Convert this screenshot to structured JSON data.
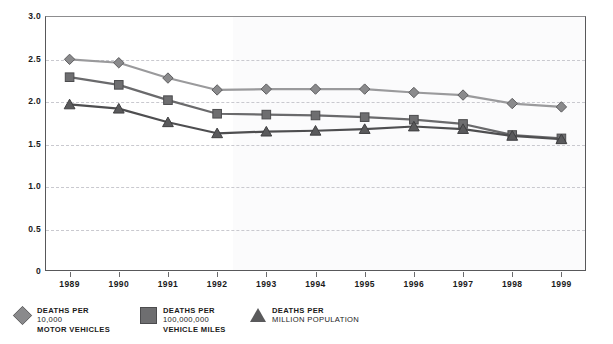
{
  "chart_data": {
    "type": "line",
    "title": "",
    "xlabel": "",
    "ylabel": "",
    "x": [
      "1989",
      "1990",
      "1991",
      "1992",
      "1993",
      "1994",
      "1995",
      "1996",
      "1997",
      "1998",
      "1999"
    ],
    "categories": [
      "1989",
      "1990",
      "1991",
      "1992",
      "1993",
      "1994",
      "1995",
      "1996",
      "1997",
      "1998",
      "1999"
    ],
    "ylim": [
      0,
      3.0
    ],
    "yticks": [
      "0",
      "0.5",
      "1.0",
      "1.5",
      "2.0",
      "2.5",
      "3.0"
    ],
    "ytick_values": [
      0,
      0.5,
      1.0,
      1.5,
      2.0,
      2.5,
      3.0
    ],
    "grid": true,
    "grid_style": "dashed-horizontal",
    "legend_position": "bottom-left",
    "series": [
      {
        "name": "DEATHS PER 10,000 MOTOR VEHICLES",
        "marker": "diamond",
        "color": "#8a8a8c",
        "line_color": "#9a9a9c",
        "values": [
          2.49,
          2.45,
          2.27,
          2.13,
          2.14,
          2.14,
          2.14,
          2.1,
          2.07,
          1.97,
          1.93
        ]
      },
      {
        "name": "DEATHS PER 100,000,000 VEHICLE MILES",
        "marker": "square",
        "color": "#6e6e70",
        "line_color": "#6a6a6c",
        "values": [
          2.28,
          2.19,
          2.01,
          1.85,
          1.84,
          1.83,
          1.81,
          1.78,
          1.73,
          1.6,
          1.56
        ]
      },
      {
        "name": "DEATHS PER MILLION POPULATION",
        "marker": "triangle",
        "color": "#5a5a5c",
        "line_color": "#4e4e50",
        "values": [
          1.96,
          1.91,
          1.75,
          1.62,
          1.64,
          1.65,
          1.67,
          1.7,
          1.67,
          1.59,
          1.55
        ]
      }
    ]
  },
  "legend": {
    "items": [
      {
        "marker": "diamond-marker",
        "line1": "DEATHS PER",
        "line2": "10,000",
        "line3": "MOTOR VEHICLES"
      },
      {
        "marker": "square-marker",
        "line1": "DEATHS PER",
        "line2": "100,000,000",
        "line3": "VEHICLE MILES"
      },
      {
        "marker": "triangle-marker",
        "line1": "DEATHS PER",
        "line2": "MILLION POPULATION",
        "line3": ""
      }
    ]
  },
  "colors": {
    "series1": "#8a8a8c",
    "series2": "#6e6e70",
    "series3": "#5a5a5c",
    "grid": "#c9c9cf",
    "axis": "#58585a",
    "background": "#ffffff",
    "shade": "#fbfbfc"
  }
}
